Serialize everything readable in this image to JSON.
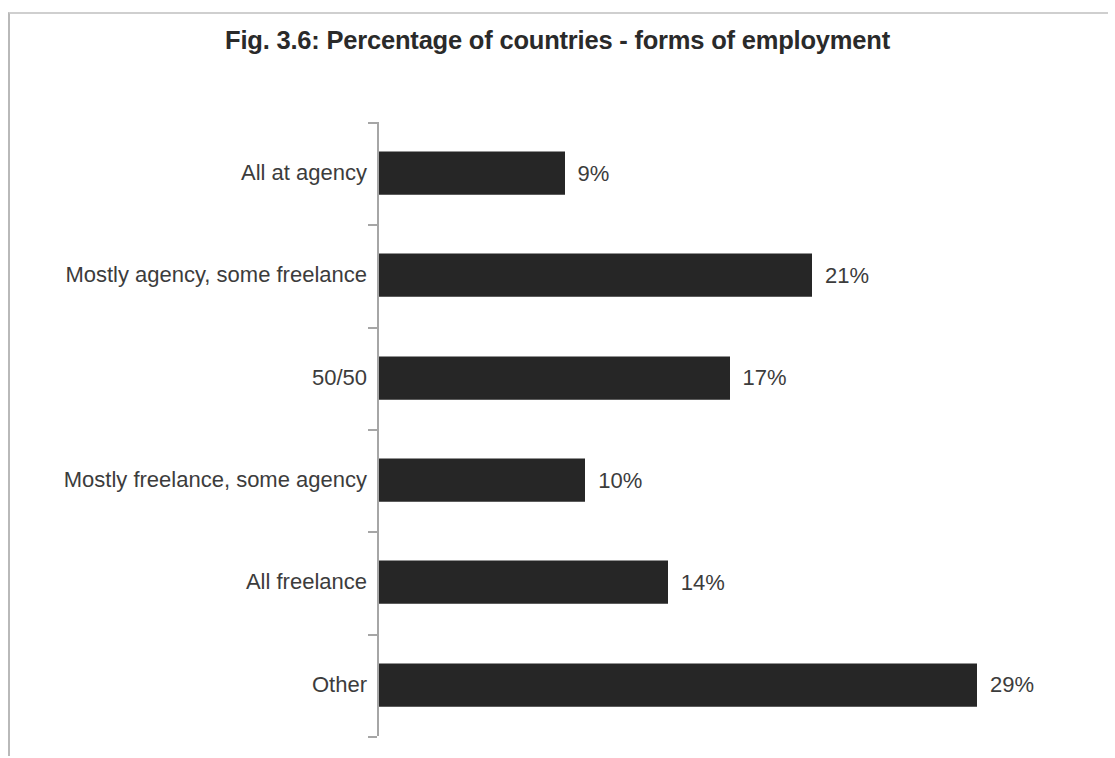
{
  "figure": {
    "title": "Fig. 3.6: Percentage of countries - forms of employment",
    "frame_color": "#b9b9b9",
    "bar_color": "#262626",
    "axis_color": "#a6a6a6",
    "text_color": "#3c3c3c"
  },
  "chart_data": {
    "type": "bar",
    "orientation": "horizontal",
    "title": "Fig. 3.6: Percentage of countries - forms of employment",
    "xlabel": "",
    "ylabel": "",
    "grid": false,
    "legend": false,
    "xlim": [
      0,
      29
    ],
    "value_suffix": "%",
    "categories": [
      "All at agency",
      "Mostly agency, some freelance",
      "50/50",
      "Mostly freelance, some agency",
      "All freelance",
      "Other"
    ],
    "values": [
      9,
      21,
      17,
      10,
      14,
      29
    ],
    "labels": [
      "9%",
      "21%",
      "17%",
      "10%",
      "14%",
      "29%"
    ]
  }
}
